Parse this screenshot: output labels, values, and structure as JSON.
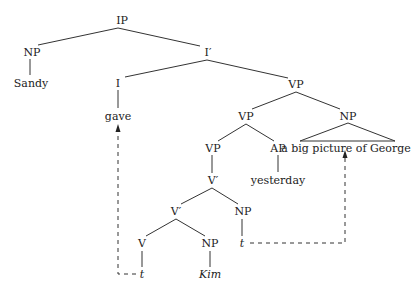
{
  "diagram": {
    "type": "syntax-tree",
    "nodes": {
      "ip": "IP",
      "np_subj": "NP",
      "sandy": "Sandy",
      "ibar": "I′",
      "i": "I",
      "gave": "gave",
      "vp_top": "VP",
      "vp_mid": "VP",
      "np_obj": "NP",
      "np_obj_text": "a big picture of George",
      "vp_low": "VP",
      "ap": "AP",
      "yesterday": "yesterday",
      "vbar_up": "V′",
      "vbar_low": "V′",
      "np_trace": "NP",
      "v": "V",
      "np_kim": "NP",
      "trace_np": "t",
      "trace_v": "t",
      "kim": "Kim"
    },
    "movement_arrows": [
      {
        "from": "t (under V)",
        "to": "gave",
        "style": "dashed"
      },
      {
        "from": "t (under NP)",
        "to": "a big picture of George",
        "style": "dashed"
      }
    ]
  }
}
